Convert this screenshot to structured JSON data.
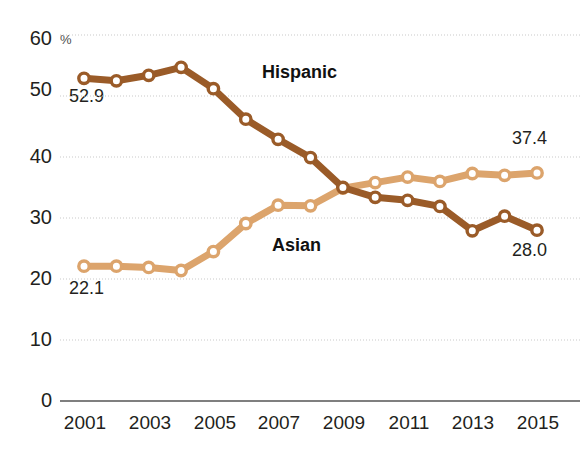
{
  "chart_data": {
    "type": "line",
    "title": "",
    "xlabel": "",
    "ylabel": "%",
    "unit_label": "%",
    "grid": true,
    "legend": "inline-series-labels",
    "ylim": [
      0,
      60
    ],
    "yticks": [
      0,
      10,
      20,
      30,
      40,
      50,
      60
    ],
    "ytick_labels": [
      "0",
      "10",
      "20",
      "30",
      "40",
      "50",
      "60"
    ],
    "x": [
      2001,
      2002,
      2003,
      2004,
      2005,
      2006,
      2007,
      2008,
      2009,
      2010,
      2011,
      2012,
      2013,
      2014,
      2015
    ],
    "xtick_labels": [
      "2001",
      "2003",
      "2005",
      "2007",
      "2009",
      "2011",
      "2013",
      "2015"
    ],
    "xticks": [
      2001,
      2003,
      2005,
      2007,
      2009,
      2011,
      2013,
      2015
    ],
    "xlim": [
      2001,
      2015
    ],
    "series": [
      {
        "name": "Hispanic",
        "color": "#9A5B28",
        "marker": "circle-open",
        "values": [
          52.9,
          52.5,
          53.4,
          54.7,
          51.2,
          46.2,
          42.9,
          39.9,
          35.0,
          33.4,
          32.9,
          31.9,
          27.9,
          30.3,
          28.0
        ],
        "start_label": "52.9",
        "end_label": "28.0"
      },
      {
        "name": "Asian",
        "color": "#DCA46C",
        "marker": "circle-open",
        "values": [
          22.1,
          22.1,
          21.9,
          21.4,
          24.5,
          29.1,
          32.1,
          32.0,
          34.9,
          35.8,
          36.7,
          36.0,
          37.3,
          37.0,
          37.4
        ],
        "start_label": "22.1",
        "end_label": "37.4"
      }
    ],
    "annotations": [
      {
        "name": "hispanic-series-label",
        "text": "Hispanic"
      },
      {
        "name": "asian-series-label",
        "text": "Asian"
      },
      {
        "name": "hispanic-start-value",
        "text": "52.9"
      },
      {
        "name": "hispanic-end-value",
        "text": "28.0"
      },
      {
        "name": "asian-start-value",
        "text": "22.1"
      },
      {
        "name": "asian-end-value",
        "text": "37.4"
      },
      {
        "name": "unit-label",
        "text": "%"
      }
    ]
  },
  "axis": {
    "y_labels": [
      "60",
      "50",
      "40",
      "30",
      "20",
      "10",
      "0"
    ],
    "x_labels": [
      "2001",
      "2003",
      "2005",
      "2007",
      "2009",
      "2011",
      "2013",
      "2015"
    ],
    "unit": "%"
  },
  "labels": {
    "hispanic": "Hispanic",
    "asian": "Asian",
    "hispanic_start": "52.9",
    "hispanic_end": "28.0",
    "asian_start": "22.1",
    "asian_end": "37.4"
  },
  "colors": {
    "hispanic": "#9A5B28",
    "asian": "#DCA46C",
    "axis": "#555555",
    "grid": "#c9c9c9",
    "text": "#231f20"
  }
}
